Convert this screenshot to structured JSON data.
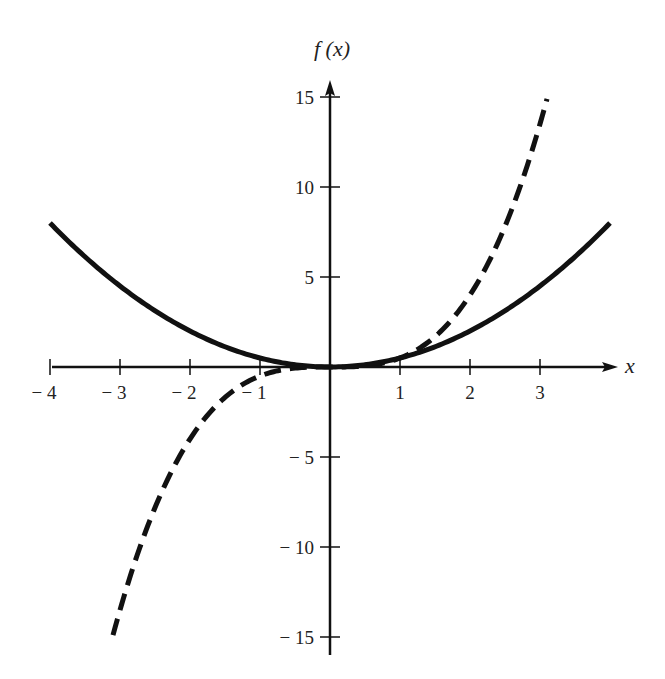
{
  "chart_data": {
    "type": "line",
    "title": "",
    "xlabel": "x",
    "ylabel": "f (x)",
    "xlim": [
      -4,
      4
    ],
    "ylim": [
      -16,
      16
    ],
    "grid": false,
    "legend": null,
    "x_ticks": [
      -4,
      -3,
      -2,
      -1,
      1,
      2,
      3
    ],
    "x_tick_labels": [
      "− 4",
      "− 3",
      "− 2",
      "− 1",
      "1",
      "2",
      "3"
    ],
    "y_ticks": [
      15,
      10,
      5,
      -5,
      -10,
      -15
    ],
    "y_tick_labels": [
      "15",
      "10",
      "5",
      "− 5",
      "− 10",
      "− 15"
    ],
    "series": [
      {
        "name": "solid curve (f(x) = x²/2)",
        "style": "solid",
        "x": [
          -4,
          -3,
          -2,
          -1,
          0,
          1,
          2,
          3,
          4
        ],
        "values": [
          8,
          4.5,
          2,
          0.5,
          0,
          0.5,
          2,
          4.5,
          8
        ]
      },
      {
        "name": "dashed curve (f(x) = x³/2)",
        "style": "dashed",
        "x": [
          -3.1,
          -3,
          -2,
          -1,
          0,
          1,
          2,
          3,
          3.1
        ],
        "values": [
          -14.9,
          -13.5,
          -4,
          -0.5,
          0,
          0.5,
          4,
          13.5,
          14.9
        ]
      }
    ],
    "colors": {
      "axis": "#111111",
      "curve": "#111111",
      "background": "#ffffff"
    }
  }
}
